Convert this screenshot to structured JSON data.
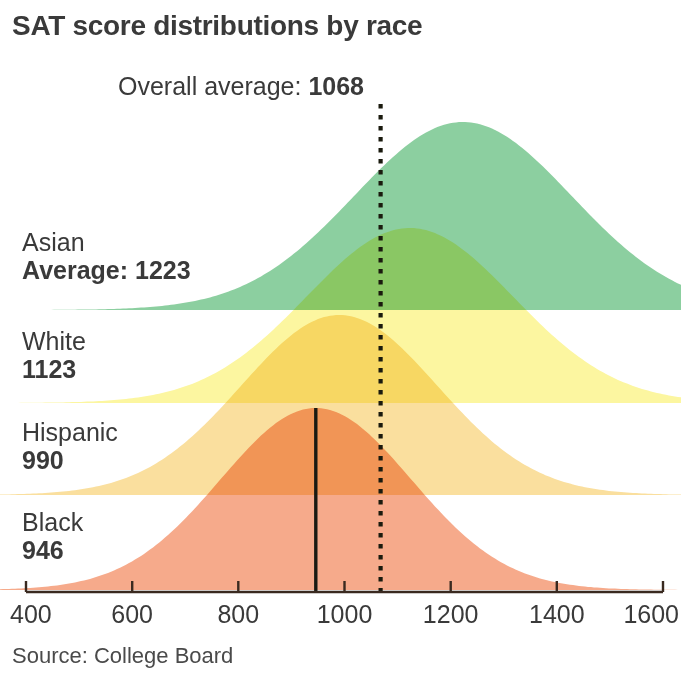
{
  "title": "SAT score distributions by race",
  "overall": {
    "label": "Overall average:",
    "value": "1068"
  },
  "source": "Source: College Board",
  "axis": {
    "ticks": [
      "400",
      "600",
      "800",
      "1000",
      "1200",
      "1400",
      "1600"
    ]
  },
  "series": [
    {
      "name": "Asian",
      "prefix": "Average:",
      "value": "1223"
    },
    {
      "name": "White",
      "prefix": "",
      "value": "1123"
    },
    {
      "name": "Hispanic",
      "prefix": "",
      "value": "990"
    },
    {
      "name": "Black",
      "prefix": "",
      "value": "946"
    }
  ],
  "colors": {
    "green": "#8ccfa0",
    "yellow": "#fcf6a0",
    "orange": "#fadf9e",
    "salmon": "#f6aa8b",
    "marker": "#1a1a12",
    "axis": "#3a2a20",
    "text": "#3a3a3a"
  },
  "chart_data": {
    "type": "area",
    "title": "SAT score distributions by race",
    "subtitle": "Overall average: 1068",
    "xlabel": "",
    "ylabel": "",
    "source": "Source: College Board",
    "xlim": [
      400,
      1600
    ],
    "xticks": [
      400,
      600,
      800,
      1000,
      1200,
      1400,
      1600
    ],
    "grid": false,
    "legend": "inline-left-labels",
    "annotations": [
      {
        "text": "Overall average: 1068",
        "x": 1068,
        "type": "vertical-dotted-line"
      }
    ],
    "series": [
      {
        "name": "Asian",
        "mean": 1223,
        "sd": 205,
        "color": "#8ccfa0",
        "marker_x": 1223
      },
      {
        "name": "White",
        "mean": 1123,
        "sd": 195,
        "color": "#fcf6a0",
        "marker_x": 1123
      },
      {
        "name": "Hispanic",
        "mean": 990,
        "sd": 185,
        "color": "#fadf9e",
        "marker_x": 990
      },
      {
        "name": "Black",
        "mean": 946,
        "sd": 180,
        "color": "#f6aa8b",
        "marker_x": 946
      }
    ]
  }
}
